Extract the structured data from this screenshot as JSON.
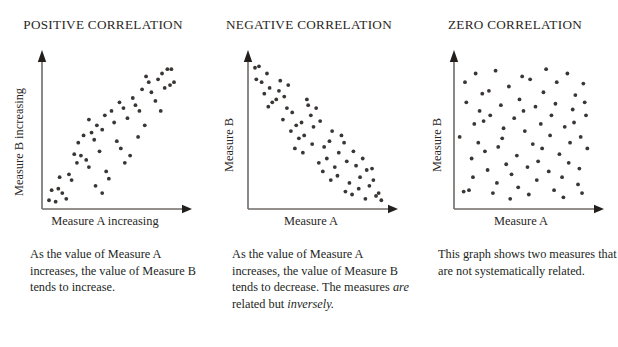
{
  "figure": {
    "background_color": "#ffffff",
    "text_color": "#231f1d",
    "axis_color": "#6e6a67",
    "dot_color": "#3a3634"
  },
  "panels": [
    {
      "id": "positive-correlation",
      "title": "POSITIVE CORRELATION",
      "y_axis_label": "Measure B increasing",
      "x_axis_label": "Measure A increasing",
      "caption_runs": [
        {
          "text": "As the value of Measure A increases, the value of Measure B tends to increase.",
          "italic": false
        }
      ],
      "caption_plain": "As the value of Measure A increases, the value of Measure B tends to increase."
    },
    {
      "id": "negative-correlation",
      "title": "NEGATIVE CORRELATION",
      "y_axis_label": "Measure B",
      "x_axis_label": "Measure A",
      "caption_runs": [
        {
          "text": "As the value of Measure A increases, the value of Measure B tends to decrease. The measures ",
          "italic": false
        },
        {
          "text": "are",
          "italic": true
        },
        {
          "text": " related but ",
          "italic": false
        },
        {
          "text": "inversely.",
          "italic": true
        }
      ],
      "caption_plain": "As the value of Measure A increases, the value of Measure B tends to decrease. The measures are related but inversely."
    },
    {
      "id": "zero-correlation",
      "title": "ZERO CORRELATION",
      "y_axis_label": "Measure B",
      "x_axis_label": "Measure A",
      "caption_runs": [
        {
          "text": "This graph shows two measures that are not systematically related.",
          "italic": false
        }
      ],
      "caption_plain": "This graph shows two measures that are not systematically related."
    }
  ],
  "chart_data": [
    {
      "type": "scatter",
      "title": "POSITIVE CORRELATION",
      "xlabel": "Measure A increasing",
      "ylabel": "Measure B increasing",
      "xlim": [
        0,
        100
      ],
      "ylim": [
        0,
        100
      ],
      "grid": false,
      "legend": "none",
      "relationship": "positive",
      "points": [
        [
          3,
          4
        ],
        [
          5,
          11
        ],
        [
          8,
          3
        ],
        [
          10,
          12
        ],
        [
          13,
          9
        ],
        [
          16,
          5
        ],
        [
          11,
          20
        ],
        [
          18,
          22
        ],
        [
          20,
          18
        ],
        [
          24,
          30
        ],
        [
          22,
          36
        ],
        [
          27,
          35
        ],
        [
          25,
          44
        ],
        [
          31,
          32
        ],
        [
          33,
          27
        ],
        [
          29,
          49
        ],
        [
          35,
          51
        ],
        [
          37,
          46
        ],
        [
          33,
          60
        ],
        [
          39,
          56
        ],
        [
          41,
          38
        ],
        [
          43,
          53
        ],
        [
          38,
          14
        ],
        [
          43,
          9
        ],
        [
          46,
          24
        ],
        [
          48,
          19
        ],
        [
          45,
          63
        ],
        [
          50,
          66
        ],
        [
          52,
          58
        ],
        [
          54,
          45
        ],
        [
          57,
          40
        ],
        [
          56,
          72
        ],
        [
          59,
          68
        ],
        [
          62,
          61
        ],
        [
          60,
          30
        ],
        [
          64,
          35
        ],
        [
          66,
          75
        ],
        [
          68,
          70
        ],
        [
          71,
          66
        ],
        [
          73,
          81
        ],
        [
          70,
          48
        ],
        [
          75,
          56
        ],
        [
          78,
          86
        ],
        [
          80,
          79
        ],
        [
          76,
          90
        ],
        [
          83,
          73
        ],
        [
          85,
          88
        ],
        [
          88,
          92
        ],
        [
          87,
          66
        ],
        [
          90,
          82
        ],
        [
          92,
          95
        ],
        [
          95,
          95
        ],
        [
          94,
          84
        ],
        [
          97,
          86
        ]
      ]
    },
    {
      "type": "scatter",
      "title": "NEGATIVE CORRELATION",
      "xlabel": "Measure A",
      "ylabel": "Measure B",
      "xlim": [
        0,
        100
      ],
      "ylim": [
        0,
        100
      ],
      "grid": false,
      "legend": "none",
      "relationship": "negative",
      "points": [
        [
          3,
          96
        ],
        [
          6,
          97
        ],
        [
          4,
          88
        ],
        [
          8,
          86
        ],
        [
          12,
          92
        ],
        [
          10,
          78
        ],
        [
          14,
          82
        ],
        [
          16,
          72
        ],
        [
          19,
          74
        ],
        [
          13,
          69
        ],
        [
          22,
          87
        ],
        [
          21,
          80
        ],
        [
          25,
          76
        ],
        [
          27,
          68
        ],
        [
          28,
          84
        ],
        [
          24,
          60
        ],
        [
          31,
          65
        ],
        [
          30,
          52
        ],
        [
          34,
          56
        ],
        [
          36,
          47
        ],
        [
          33,
          40
        ],
        [
          38,
          58
        ],
        [
          40,
          49
        ],
        [
          39,
          37
        ],
        [
          43,
          70
        ],
        [
          45,
          63
        ],
        [
          42,
          74
        ],
        [
          47,
          55
        ],
        [
          49,
          68
        ],
        [
          46,
          43
        ],
        [
          52,
          59
        ],
        [
          51,
          30
        ],
        [
          55,
          41
        ],
        [
          57,
          33
        ],
        [
          54,
          24
        ],
        [
          59,
          45
        ],
        [
          61,
          52
        ],
        [
          63,
          27
        ],
        [
          60,
          18
        ],
        [
          66,
          37
        ],
        [
          68,
          49
        ],
        [
          65,
          21
        ],
        [
          70,
          44
        ],
        [
          72,
          31
        ],
        [
          74,
          16
        ],
        [
          71,
          10
        ],
        [
          77,
          38
        ],
        [
          79,
          28
        ],
        [
          76,
          8
        ],
        [
          82,
          20
        ],
        [
          84,
          33
        ],
        [
          81,
          12
        ],
        [
          87,
          25
        ],
        [
          89,
          14
        ],
        [
          86,
          5
        ],
        [
          92,
          18
        ],
        [
          94,
          7
        ],
        [
          91,
          26
        ],
        [
          96,
          9
        ],
        [
          98,
          4
        ]
      ]
    },
    {
      "type": "scatter",
      "title": "ZERO CORRELATION",
      "xlabel": "Measure A",
      "ylabel": "Measure B",
      "xlim": [
        0,
        100
      ],
      "ylim": [
        0,
        100
      ],
      "grid": false,
      "legend": "none",
      "relationship": "none",
      "points": [
        [
          2,
          48
        ],
        [
          5,
          10
        ],
        [
          9,
          11
        ],
        [
          7,
          72
        ],
        [
          11,
          33
        ],
        [
          13,
          57
        ],
        [
          6,
          86
        ],
        [
          14,
          92
        ],
        [
          12,
          20
        ],
        [
          17,
          66
        ],
        [
          19,
          78
        ],
        [
          16,
          44
        ],
        [
          21,
          38
        ],
        [
          23,
          25
        ],
        [
          20,
          59
        ],
        [
          25,
          63
        ],
        [
          27,
          9
        ],
        [
          24,
          80
        ],
        [
          29,
          94
        ],
        [
          31,
          41
        ],
        [
          33,
          70
        ],
        [
          30,
          16
        ],
        [
          35,
          54
        ],
        [
          37,
          29
        ],
        [
          34,
          47
        ],
        [
          39,
          83
        ],
        [
          41,
          22
        ],
        [
          43,
          61
        ],
        [
          40,
          5
        ],
        [
          45,
          35
        ],
        [
          47,
          74
        ],
        [
          49,
          90
        ],
        [
          46,
          13
        ],
        [
          51,
          52
        ],
        [
          53,
          27
        ],
        [
          50,
          66
        ],
        [
          55,
          88
        ],
        [
          57,
          43
        ],
        [
          54,
          8
        ],
        [
          59,
          69
        ],
        [
          61,
          31
        ],
        [
          63,
          57
        ],
        [
          60,
          18
        ],
        [
          65,
          79
        ],
        [
          67,
          95
        ],
        [
          64,
          40
        ],
        [
          69,
          24
        ],
        [
          71,
          63
        ],
        [
          73,
          11
        ],
        [
          70,
          49
        ],
        [
          75,
          86
        ],
        [
          77,
          36
        ],
        [
          74,
          71
        ],
        [
          79,
          20
        ],
        [
          81,
          55
        ],
        [
          83,
          92
        ],
        [
          80,
          6
        ],
        [
          85,
          44
        ],
        [
          87,
          67
        ],
        [
          84,
          30
        ],
        [
          89,
          77
        ],
        [
          91,
          15
        ],
        [
          88,
          58
        ],
        [
          93,
          48
        ],
        [
          95,
          85
        ],
        [
          92,
          26
        ],
        [
          97,
          63
        ],
        [
          94,
          9
        ],
        [
          98,
          40
        ],
        [
          96,
          72
        ]
      ]
    }
  ]
}
